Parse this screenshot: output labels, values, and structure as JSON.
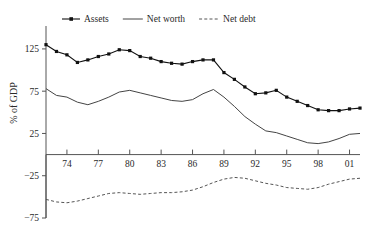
{
  "chart_data": {
    "type": "line",
    "title": "",
    "xlabel": "",
    "ylabel": "% of GDP",
    "ylim": [
      -75,
      145
    ],
    "xlim": [
      1972,
      2002
    ],
    "grid": false,
    "legend_position": "top",
    "y_ticks": [
      125,
      75,
      25,
      -25,
      -75
    ],
    "y_tick_labels": [
      "125",
      "75",
      "25",
      "−25",
      "−75"
    ],
    "x_ticks": [
      1974,
      1977,
      1980,
      1983,
      1986,
      1989,
      1992,
      1995,
      1998,
      2001
    ],
    "x_tick_labels": [
      "74",
      "77",
      "80",
      "83",
      "86",
      "89",
      "92",
      "95",
      "98",
      "01"
    ],
    "x": [
      1972,
      1973,
      1974,
      1975,
      1976,
      1977,
      1978,
      1979,
      1980,
      1981,
      1982,
      1983,
      1984,
      1985,
      1986,
      1987,
      1988,
      1989,
      1990,
      1991,
      1992,
      1993,
      1994,
      1995,
      1996,
      1997,
      1998,
      1999,
      2000,
      2001,
      2002
    ],
    "series": [
      {
        "name": "Assets",
        "style": "solid-markers",
        "color": "#111111",
        "values": [
          130,
          122,
          118,
          109,
          112,
          116,
          119,
          124,
          123,
          116,
          114,
          110,
          108,
          107,
          110,
          112,
          112,
          97,
          89,
          80,
          72,
          73,
          76,
          68,
          63,
          58,
          53,
          52,
          52,
          54,
          55
        ]
      },
      {
        "name": "Net worth",
        "style": "solid",
        "color": "#444444",
        "values": [
          78,
          70,
          68,
          62,
          59,
          63,
          68,
          74,
          76,
          73,
          70,
          67,
          64,
          63,
          65,
          72,
          77,
          68,
          57,
          45,
          36,
          28,
          26,
          22,
          18,
          14,
          13,
          15,
          19,
          24,
          25
        ]
      },
      {
        "name": "Net debt",
        "style": "dashed",
        "color": "#555555",
        "values": [
          -53,
          -56,
          -57,
          -55,
          -52,
          -49,
          -46,
          -45,
          -46,
          -47,
          -46,
          -45,
          -45,
          -44,
          -42,
          -38,
          -33,
          -29,
          -27,
          -28,
          -31,
          -34,
          -36,
          -39,
          -40,
          -41,
          -39,
          -35,
          -32,
          -29,
          -28
        ]
      }
    ],
    "legend": [
      {
        "label": "Assets",
        "style": "solid-markers"
      },
      {
        "label": "Net worth",
        "style": "solid"
      },
      {
        "label": "Net debt",
        "style": "dashed"
      }
    ]
  }
}
